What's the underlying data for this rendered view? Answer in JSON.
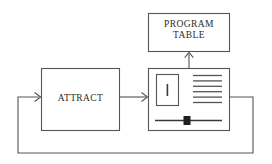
{
  "diagram": {
    "type": "block-flow-diagram",
    "canvas": {
      "width": 272,
      "height": 164,
      "background": "#ffffff"
    },
    "stroke_color": "#555555",
    "text_color": "#2b2b2b",
    "nodes": [
      {
        "id": "program-table",
        "label": "PROGRAM\nTABLE",
        "shape": "rectangle",
        "x": 148,
        "y": 13,
        "width": 82,
        "height": 39
      },
      {
        "id": "attract",
        "label": "ATTRACT",
        "shape": "rectangle",
        "x": 41,
        "y": 68,
        "width": 79,
        "height": 63
      },
      {
        "id": "display-unit",
        "label": "",
        "shape": "rectangle-with-screen-contents",
        "x": 148,
        "y": 68,
        "width": 82,
        "height": 63,
        "contents": {
          "cursor_box": {
            "x": 156,
            "y": 74,
            "width": 23,
            "height": 32,
            "caret": "I"
          },
          "text_lines": {
            "count": 6,
            "x": 193,
            "y": 75,
            "width": 29,
            "spacing": 5.4
          },
          "slider": {
            "x": 155,
            "y": 117,
            "width": 67,
            "handle_x": 184,
            "handle_width": 7,
            "handle_height": 9
          }
        }
      }
    ],
    "edges": [
      {
        "id": "attract-to-display",
        "from": "attract",
        "to": "display-unit",
        "arrow": true
      },
      {
        "id": "display-to-program-table",
        "from": "display-unit",
        "to": "program-table",
        "arrow": true
      },
      {
        "id": "display-feedback-to-attract",
        "from": "display-unit",
        "to": "attract",
        "arrow": true,
        "style": "feedback-loop"
      }
    ]
  }
}
